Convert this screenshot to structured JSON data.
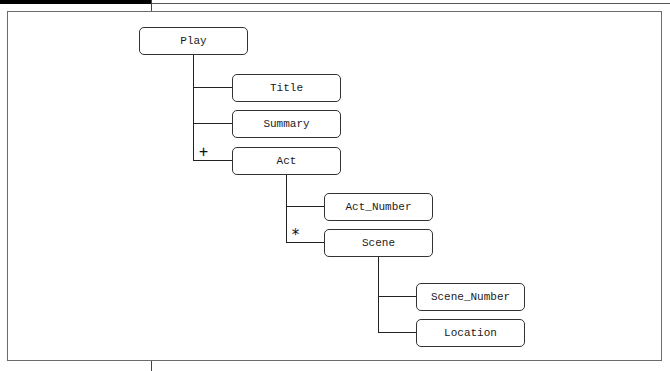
{
  "diagram": {
    "type": "tree",
    "root": {
      "label": "Play",
      "children": [
        {
          "label": "Title",
          "cardinality": ""
        },
        {
          "label": "Summary",
          "cardinality": ""
        },
        {
          "label": "Act",
          "cardinality": "+",
          "children": [
            {
              "label": "Act_Number",
              "cardinality": ""
            },
            {
              "label": "Scene",
              "cardinality": "*",
              "children": [
                {
                  "label": "Scene_Number",
                  "cardinality": ""
                },
                {
                  "label": "Location",
                  "cardinality": ""
                }
              ]
            }
          ]
        }
      ]
    }
  },
  "nodes": {
    "play": "Play",
    "title": "Title",
    "summary": "Summary",
    "act": "Act",
    "act_number": "Act_Number",
    "scene": "Scene",
    "scene_number": "Scene_Number",
    "location": "Location"
  },
  "cardinality": {
    "act": "+",
    "scene": "*"
  },
  "colors": {
    "background": "#ffffff",
    "line": "#222222",
    "frame": "#6b6b6b",
    "top_bar": "#000000"
  }
}
